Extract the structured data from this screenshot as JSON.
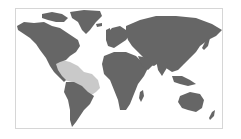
{
  "map": {
    "type": "world-range-map",
    "colors": {
      "land": "#666666",
      "highlight": "#c9c9c9",
      "frame": "#d6d6d6",
      "ocean": "#ffffff"
    },
    "highlighted_region": "Central America, Caribbean and northeastern South American coast"
  }
}
